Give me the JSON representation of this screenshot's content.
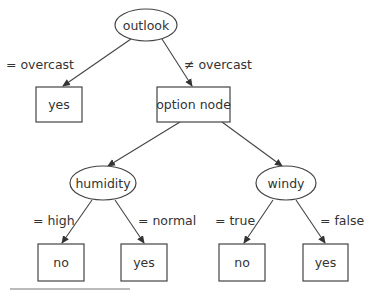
{
  "diagram": {
    "type": "decision-tree",
    "nodes": {
      "root": {
        "label": "outlook",
        "shape": "ellipse"
      },
      "leaf_overcast": {
        "label": "yes",
        "shape": "box"
      },
      "option": {
        "label": "option node",
        "shape": "box"
      },
      "humidity": {
        "label": "humidity",
        "shape": "ellipse"
      },
      "windy": {
        "label": "windy",
        "shape": "ellipse"
      },
      "leaf_high": {
        "label": "no",
        "shape": "box"
      },
      "leaf_normal": {
        "label": "yes",
        "shape": "box"
      },
      "leaf_true": {
        "label": "no",
        "shape": "box"
      },
      "leaf_false": {
        "label": "yes",
        "shape": "box"
      }
    },
    "edges": {
      "overcast": {
        "label": "= overcast",
        "from": "outlook",
        "to": "yes"
      },
      "not_overcast": {
        "label": "≠ overcast",
        "from": "outlook",
        "to": "option node"
      },
      "to_humidity": {
        "from": "option node",
        "to": "humidity"
      },
      "to_windy": {
        "from": "option node",
        "to": "windy"
      },
      "high": {
        "label": "= high",
        "from": "humidity",
        "to": "no"
      },
      "normal": {
        "label": "= normal",
        "from": "humidity",
        "to": "yes"
      },
      "true": {
        "label": "= true",
        "from": "windy",
        "to": "no"
      },
      "false": {
        "label": "= false",
        "from": "windy",
        "to": "yes"
      }
    }
  }
}
